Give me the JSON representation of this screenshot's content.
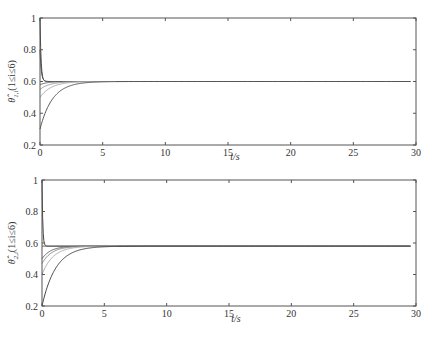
{
  "chart_data": [
    {
      "type": "line",
      "title": "",
      "xlabel": "t/s",
      "ylabel": "θ̂_1,i (1 ≤ i ≤ 6)",
      "ylabel_main": "θ̂",
      "ylabel_sub": "1,i",
      "ylabel_rest": "(1≤i≤6)",
      "xlim": [
        0,
        30
      ],
      "ylim": [
        0.2,
        1
      ],
      "xticks": [
        0,
        5,
        10,
        15,
        20,
        25,
        30
      ],
      "yticks": [
        0.2,
        0.4,
        0.6,
        0.8,
        1
      ],
      "ytick_labels": [
        "0.2",
        "0.4",
        "0.6",
        "0.8",
        "1"
      ],
      "grid": false,
      "converged_value": 0.6,
      "series": [
        {
          "name": "i=1",
          "initial": 1.0,
          "final": 0.6,
          "tau": 0.08,
          "color": "#444444"
        },
        {
          "name": "i=2",
          "initial": 0.8,
          "final": 0.6,
          "tau": 0.1,
          "color": "#555555"
        },
        {
          "name": "i=3",
          "initial": 0.58,
          "final": 0.6,
          "tau": 0.6,
          "color": "#666666"
        },
        {
          "name": "i=4",
          "initial": 0.55,
          "final": 0.6,
          "tau": 0.8,
          "color": "#999999"
        },
        {
          "name": "i=5",
          "initial": 0.5,
          "final": 0.6,
          "tau": 0.9,
          "color": "#aaaaaa"
        },
        {
          "name": "i=6",
          "initial": 0.3,
          "final": 0.6,
          "tau": 1.0,
          "color": "#555555"
        }
      ]
    },
    {
      "type": "line",
      "title": "",
      "xlabel": "t/s",
      "ylabel": "θ̂_2,i (1 ≤ i ≤ 6)",
      "ylabel_main": "θ̂",
      "ylabel_sub": "2,i",
      "ylabel_rest": "(1≤i≤6)",
      "xlim": [
        0,
        30
      ],
      "ylim": [
        0.2,
        1
      ],
      "xticks": [
        0,
        5,
        10,
        15,
        20,
        25,
        30
      ],
      "yticks": [
        0.2,
        0.4,
        0.6,
        0.8,
        1
      ],
      "ytick_labels": [
        "0.2",
        "0.4",
        "0.6",
        "0.8",
        "1"
      ],
      "grid": false,
      "converged_value": 0.58,
      "series": [
        {
          "name": "i=1",
          "initial": 1.0,
          "final": 0.58,
          "tau": 0.06,
          "color": "#444444"
        },
        {
          "name": "i=2",
          "initial": 0.58,
          "final": 0.58,
          "tau": 0.1,
          "color": "#555555"
        },
        {
          "name": "i=3",
          "initial": 0.5,
          "final": 0.58,
          "tau": 0.7,
          "color": "#666666"
        },
        {
          "name": "i=4",
          "initial": 0.47,
          "final": 0.58,
          "tau": 0.8,
          "color": "#888888"
        },
        {
          "name": "i=5",
          "initial": 0.4,
          "final": 0.58,
          "tau": 0.9,
          "color": "#aaaaaa"
        },
        {
          "name": "i=6",
          "initial": 0.2,
          "final": 0.58,
          "tau": 1.1,
          "color": "#444444"
        }
      ]
    }
  ],
  "panels": [
    {
      "box": {
        "x0": 40,
        "y0": 18,
        "x1": 416,
        "y1": 145
      },
      "xlabel_y": 160
    },
    {
      "box": {
        "x0": 42,
        "y0": 180,
        "x1": 416,
        "y1": 306
      },
      "xlabel_y": 322
    }
  ]
}
